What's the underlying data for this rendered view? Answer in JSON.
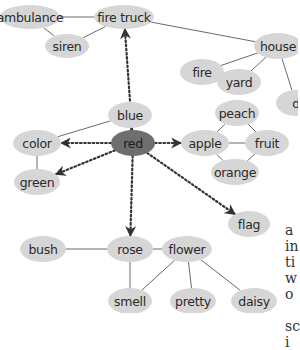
{
  "diagram": {
    "type": "semantic-network",
    "colors": {
      "node_fill": "#d6d6d6",
      "central_node_fill": "#6e6e6e",
      "edge": "#6a6a6a",
      "arrow": "#333333",
      "text": "#2a2a2a"
    },
    "nodes": {
      "ambulance": {
        "label": "ambulance",
        "x": 30,
        "y": 17,
        "rx": 30,
        "ry": 12
      },
      "fire_truck": {
        "label": "fire truck",
        "x": 124,
        "y": 17,
        "rx": 30,
        "ry": 12
      },
      "siren": {
        "label": "siren",
        "x": 67,
        "y": 46,
        "rx": 22,
        "ry": 12
      },
      "house": {
        "label": "house",
        "x": 278,
        "y": 46,
        "rx": 24,
        "ry": 13
      },
      "fire": {
        "label": "fire",
        "x": 202,
        "y": 72,
        "rx": 22,
        "ry": 13
      },
      "yard": {
        "label": "yard",
        "x": 239,
        "y": 82,
        "rx": 22,
        "ry": 13
      },
      "d_partial": {
        "label": "d",
        "x": 296,
        "y": 103,
        "rx": 20,
        "ry": 13
      },
      "peach": {
        "label": "peach",
        "x": 237,
        "y": 113,
        "rx": 22,
        "ry": 13
      },
      "apple": {
        "label": "apple",
        "x": 205,
        "y": 143,
        "rx": 24,
        "ry": 13
      },
      "fruit": {
        "label": "fruit",
        "x": 267,
        "y": 143,
        "rx": 22,
        "ry": 13
      },
      "orange": {
        "label": "orange",
        "x": 235,
        "y": 172,
        "rx": 24,
        "ry": 13
      },
      "blue": {
        "label": "blue",
        "x": 130,
        "y": 115,
        "rx": 22,
        "ry": 13
      },
      "color": {
        "label": "color",
        "x": 37,
        "y": 143,
        "rx": 24,
        "ry": 13
      },
      "green": {
        "label": "green",
        "x": 37,
        "y": 182,
        "rx": 23,
        "ry": 13
      },
      "red": {
        "label": "red",
        "x": 133,
        "y": 143,
        "rx": 22,
        "ry": 13
      },
      "flag": {
        "label": "flag",
        "x": 249,
        "y": 224,
        "rx": 21,
        "ry": 13
      },
      "bush": {
        "label": "bush",
        "x": 43,
        "y": 249,
        "rx": 23,
        "ry": 13
      },
      "rose": {
        "label": "rose",
        "x": 130,
        "y": 249,
        "rx": 23,
        "ry": 13
      },
      "flower": {
        "label": "flower",
        "x": 187,
        "y": 249,
        "rx": 25,
        "ry": 13
      },
      "smell": {
        "label": "smell",
        "x": 130,
        "y": 301,
        "rx": 22,
        "ry": 13
      },
      "pretty": {
        "label": "pretty",
        "x": 193,
        "y": 301,
        "rx": 23,
        "ry": 13
      },
      "daisy": {
        "label": "daisy",
        "x": 254,
        "y": 301,
        "rx": 23,
        "ry": 13
      }
    },
    "central_node": "red",
    "edges": [
      [
        "ambulance",
        "fire_truck"
      ],
      [
        "ambulance",
        "siren"
      ],
      [
        "siren",
        "fire_truck"
      ],
      [
        "fire_truck",
        "house"
      ],
      [
        "house",
        "fire"
      ],
      [
        "house",
        "yard"
      ],
      [
        "house",
        "d_partial"
      ],
      [
        "peach",
        "apple"
      ],
      [
        "peach",
        "fruit"
      ],
      [
        "apple",
        "fruit"
      ],
      [
        "apple",
        "orange"
      ],
      [
        "orange",
        "fruit"
      ],
      [
        "blue",
        "color"
      ],
      [
        "color",
        "green"
      ],
      [
        "bush",
        "rose"
      ],
      [
        "rose",
        "flower"
      ],
      [
        "rose",
        "smell"
      ],
      [
        "flower",
        "smell"
      ],
      [
        "flower",
        "pretty"
      ],
      [
        "flower",
        "daisy"
      ]
    ],
    "arrows": [
      [
        "red",
        "fire_truck"
      ],
      [
        "red",
        "blue"
      ],
      [
        "red",
        "color"
      ],
      [
        "red",
        "green"
      ],
      [
        "red",
        "apple"
      ],
      [
        "red",
        "rose"
      ],
      [
        "red",
        "flag"
      ]
    ]
  },
  "side_text": {
    "lines": [
      "a",
      "in",
      "ti",
      "w",
      "o",
      "",
      "sc",
      "i"
    ]
  }
}
